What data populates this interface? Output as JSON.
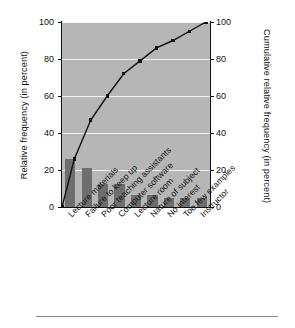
{
  "axes": {
    "left_label": "Relative frequency (in percent)",
    "right_label": "Cumulative relative frequency (in percent)",
    "left_ticks": [
      "0",
      "20",
      "40",
      "60",
      "80",
      "100"
    ],
    "right_ticks": [
      "0",
      "20",
      "40",
      "60",
      "80",
      "100"
    ]
  },
  "chart_data": {
    "type": "bar",
    "title": "",
    "subtitle": "",
    "xlabel": "",
    "ylabel": "Relative frequency (in percent)",
    "y2label": "Cumulative relative frequency (in percent)",
    "ylim": [
      0,
      100
    ],
    "y2lim": [
      0,
      100
    ],
    "yticks": [
      0,
      20,
      40,
      60,
      80,
      100
    ],
    "y2ticks": [
      0,
      20,
      40,
      60,
      80,
      100
    ],
    "grid": true,
    "grid_axis": "y",
    "legend": false,
    "legend_position": "none",
    "categories": [
      "Lecture materials",
      "Failure to keep up",
      "Poor teaching assistants",
      "Computer software",
      "Lecture room",
      "Nature of subject",
      "No interest",
      "Too few examples",
      "Instructor"
    ],
    "series": [
      {
        "name": "Relative frequency",
        "type": "bar",
        "axis": "left",
        "color": "#6e6e6e",
        "values": [
          26,
          21,
          12.5,
          12.5,
          6.5,
          6.5,
          5,
          5,
          5
        ]
      },
      {
        "name": "Cumulative relative frequency",
        "type": "line",
        "axis": "right",
        "color": "#101010",
        "marker": "square",
        "values": [
          26,
          47,
          60,
          72,
          79,
          86,
          90,
          95,
          100
        ],
        "origin_value": 0
      }
    ]
  }
}
